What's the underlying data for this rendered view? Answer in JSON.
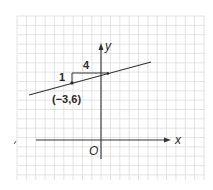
{
  "figure": {
    "axes": {
      "x_label": "x",
      "y_label": "y",
      "origin_label": "O"
    },
    "point": {
      "label": "(−3,6)",
      "x": -3,
      "y": 6
    },
    "slope_triangle": {
      "rise_label": "1",
      "run_label": "4"
    },
    "colors": {
      "grid": "#d9d9d9",
      "ink": "#333333",
      "background": "#ffffff"
    }
  },
  "chart_data": {
    "type": "line",
    "title": "",
    "xlabel": "x",
    "ylabel": "y",
    "grid": true,
    "series": [
      {
        "name": "line through (-3,6) with slope 1/4",
        "x": [
          -8,
          5
        ],
        "y": [
          4.75,
          8
        ]
      }
    ],
    "points": [
      {
        "label": "(-3,6)",
        "x": -3,
        "y": 6
      }
    ],
    "annotations": [
      {
        "text": "1",
        "meaning": "rise"
      },
      {
        "text": "4",
        "meaning": "run"
      }
    ]
  }
}
